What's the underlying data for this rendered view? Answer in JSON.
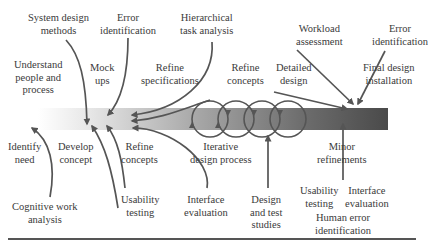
{
  "diagram": {
    "type": "design-process-timeline",
    "bar": {
      "gradient_start": "#ffffff",
      "gradient_end": "#4a4a4a"
    },
    "labels_above": {
      "system_design_methods": "System design\nmethods",
      "error_identification_1": "Error\nidentification",
      "hierarchical_task_analysis": "Hierarchical\ntask analysis",
      "workload_assessment": "Workload\nassessment",
      "error_identification_2": "Error\nidentification",
      "understand_people": "Understand\npeople and\nprocess",
      "mock_ups": "Mock\nups",
      "refine_specifications": "Refine\nspecifications",
      "refine_concepts_top": "Refine\nconcepts",
      "detailed_design": "Detailed\ndesign",
      "final_design_installation": "Final design\ninstallation"
    },
    "labels_below": {
      "identify_need": "Identify\nneed",
      "develop_concept": "Develop\nconcept",
      "refine_concepts_bottom": "Refine\nconcepts",
      "iterative_design_process": "Iterative\ndesign process",
      "minor_refinements": "Minor\nrefinements",
      "cognitive_work_analysis": "Cognitive work\nanalysis",
      "usability_testing_1": "Usability\ntesting",
      "interface_evaluation_1": "Interface\nevaluation",
      "design_and_test_studies": "Design\nand test\nstudies",
      "usability_testing_2": "Usability\ntesting",
      "interface_evaluation_2": "Interface\nevaluation",
      "human_error_identification": "Human error\nidentification"
    }
  }
}
